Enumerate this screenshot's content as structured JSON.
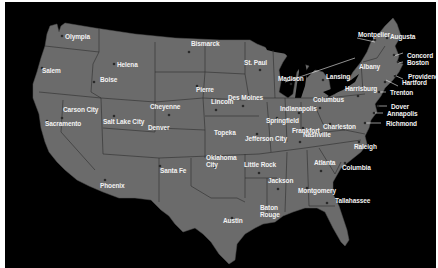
{
  "map": {
    "title": "United States State Capitals",
    "colors": {
      "background": "#000000",
      "land": "#6b6b6b",
      "border": "#2a2a2a",
      "label": "#f2f2f2",
      "dot": "#2a2a2a"
    },
    "capitals": [
      {
        "name": "Olympia",
        "x": 57,
        "y": 34,
        "dx": 0,
        "dy": 0
      },
      {
        "name": "Salem",
        "x": 37,
        "y": 66,
        "dx": -3,
        "dy": 2
      },
      {
        "name": "Helena",
        "x": 109,
        "y": 62,
        "dx": 0,
        "dy": 0
      },
      {
        "name": "Boise",
        "x": 89,
        "y": 80,
        "dx": 3,
        "dy": -3
      },
      {
        "name": "Bismarck",
        "x": 184,
        "y": 50,
        "dx": -1,
        "dy": -9
      },
      {
        "name": "St. Paul",
        "x": 255,
        "y": 68,
        "dx": -19,
        "dy": -8
      },
      {
        "name": "Pierre",
        "x": 192,
        "y": 84,
        "dx": -4,
        "dy": 3
      },
      {
        "name": "Madison",
        "x": 286,
        "y": 82,
        "dx": -16,
        "dy": -6
      },
      {
        "name": "Lansing",
        "x": 318,
        "y": 78,
        "dx": 0,
        "dy": -4
      },
      {
        "name": "Montpelier",
        "x": 370,
        "y": 38,
        "dx": -20,
        "dy": -6
      },
      {
        "name": "Augusta",
        "x": 382,
        "y": 36,
        "dx": 0,
        "dy": -2
      },
      {
        "name": "Concord",
        "x": 389,
        "y": 53,
        "dx": 10,
        "dy": 0
      },
      {
        "name": "Boston",
        "x": 393,
        "y": 60,
        "dx": 6,
        "dy": 0
      },
      {
        "name": "Albany",
        "x": 357,
        "y": 64,
        "dx": -6,
        "dy": 0
      },
      {
        "name": "Providence",
        "x": 390,
        "y": 74,
        "dx": 10,
        "dy": 0
      },
      {
        "name": "Hartford",
        "x": 380,
        "y": 80,
        "dx": 14,
        "dy": 0
      },
      {
        "name": "Harrisburg",
        "x": 353,
        "y": 94,
        "dx": -16,
        "dy": -8
      },
      {
        "name": "Trenton",
        "x": 374,
        "y": 90,
        "dx": 8,
        "dy": 0
      },
      {
        "name": "Dover",
        "x": 373,
        "y": 104,
        "dx": 10,
        "dy": 0
      },
      {
        "name": "Annapolis",
        "x": 369,
        "y": 111,
        "dx": 10,
        "dy": 0
      },
      {
        "name": "Richmond",
        "x": 360,
        "y": 121,
        "dx": 18,
        "dy": 0
      },
      {
        "name": "Columbus",
        "x": 315,
        "y": 106,
        "dx": -10,
        "dy": -9
      },
      {
        "name": "Indianapolis",
        "x": 294,
        "y": 111,
        "dx": -22,
        "dy": -5
      },
      {
        "name": "Des Moines",
        "x": 238,
        "y": 104,
        "dx": -18,
        "dy": -9
      },
      {
        "name": "Springfield",
        "x": 272,
        "y": 116,
        "dx": -14,
        "dy": 2
      },
      {
        "name": "Charleston",
        "x": 325,
        "y": 122,
        "dx": -10,
        "dy": 2
      },
      {
        "name": "Frankfort",
        "x": 298,
        "y": 126,
        "dx": -14,
        "dy": 2
      },
      {
        "name": "Lincoln",
        "x": 211,
        "y": 108,
        "dx": -8,
        "dy": -9
      },
      {
        "name": "Cheyenne",
        "x": 164,
        "y": 113,
        "dx": -22,
        "dy": -9
      },
      {
        "name": "Carson City",
        "x": 57,
        "y": 116,
        "dx": -2,
        "dy": -9
      },
      {
        "name": "Sacramento",
        "x": 42,
        "y": 119,
        "dx": -5,
        "dy": 2
      },
      {
        "name": "Salt Lake City",
        "x": 109,
        "y": 114,
        "dx": -14,
        "dy": 5
      },
      {
        "name": "Denver",
        "x": 162,
        "y": 127,
        "dx": -22,
        "dy": -2
      },
      {
        "name": "Topeka",
        "x": 227,
        "y": 132,
        "dx": -21,
        "dy": -2
      },
      {
        "name": "Jefferson City",
        "x": 252,
        "y": 132,
        "dx": -15,
        "dy": 4
      },
      {
        "name": "Nashville",
        "x": 295,
        "y": 140,
        "dx": 0,
        "dy": -8
      },
      {
        "name": "Raleigh",
        "x": 354,
        "y": 140,
        "dx": -8,
        "dy": 4
      },
      {
        "name": "Atlanta",
        "x": 316,
        "y": 169,
        "dx": -10,
        "dy": -9
      },
      {
        "name": "Columbia",
        "x": 340,
        "y": 161,
        "dx": -6,
        "dy": 4
      },
      {
        "name": "Little Rock",
        "x": 254,
        "y": 171,
        "dx": -18,
        "dy": -9
      },
      {
        "name": "Oklahoma City",
        "x": 210,
        "y": 165,
        "dx": -12,
        "dy": -10,
        "multiline": true
      },
      {
        "name": "Santa Fe",
        "x": 155,
        "y": 164,
        "dx": -3,
        "dy": 4
      },
      {
        "name": "Phoenix",
        "x": 100,
        "y": 178,
        "dx": -8,
        "dy": 5
      },
      {
        "name": "Jackson",
        "x": 273,
        "y": 187,
        "dx": -13,
        "dy": -9
      },
      {
        "name": "Montgomery",
        "x": 302,
        "y": 186,
        "dx": -12,
        "dy": 2
      },
      {
        "name": "Tallahassee",
        "x": 322,
        "y": 201,
        "dx": 5,
        "dy": -3
      },
      {
        "name": "Baton Rouge",
        "x": 268,
        "y": 212,
        "dx": -16,
        "dy": -7,
        "multiline": true
      },
      {
        "name": "Austin",
        "x": 227,
        "y": 216,
        "dx": -12,
        "dy": 2
      }
    ]
  }
}
